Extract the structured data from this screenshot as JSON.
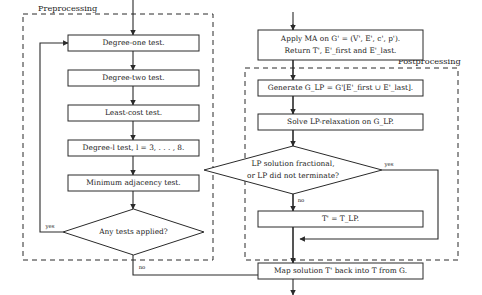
{
  "diagram": {
    "groups": [
      {
        "id": "preprocessing",
        "label": "Preprocessing"
      },
      {
        "id": "postprocessing",
        "label": "Postprocessing"
      }
    ],
    "nodes": [
      {
        "id": "degree-one-test",
        "type": "process",
        "label": "Degree-one test."
      },
      {
        "id": "degree-two-test",
        "type": "process",
        "label": "Degree-two test."
      },
      {
        "id": "least-cost-test",
        "type": "process",
        "label": "Least-cost test."
      },
      {
        "id": "degree-l-test",
        "type": "process",
        "label": "Degree-l test, l = 3, . . . , 8."
      },
      {
        "id": "minimum-adjacency-test",
        "type": "process",
        "label": "Minimum adjacency test."
      },
      {
        "id": "any-tests-applied",
        "type": "decision",
        "label": "Any tests applied?"
      },
      {
        "id": "apply-ma",
        "type": "process",
        "label_line1": "Apply MA on G' = (V', E', c', p').",
        "label_line2": "Return T', E'_first and E'_last."
      },
      {
        "id": "generate-glp",
        "type": "process",
        "label": "Generate G_LP = G'[E'_first ∪ E'_last]."
      },
      {
        "id": "solve-lp-relaxation",
        "type": "process",
        "label": "Solve LP-relaxation on G_LP."
      },
      {
        "id": "lp-check",
        "type": "decision",
        "label_line1": "LP solution fractional,",
        "label_line2": "or LP did not terminate?"
      },
      {
        "id": "assign-tlp",
        "type": "process",
        "label": "T' = T_LP."
      },
      {
        "id": "map-solution",
        "type": "process",
        "label": "Map solution T' back into T from G."
      }
    ],
    "edge_labels": {
      "any_tests_yes": "yes",
      "any_tests_no": "no",
      "lp_check_yes": "yes",
      "lp_check_no": "no"
    },
    "colors": {
      "stroke": "#2a2a2a",
      "fill": "#ffffff",
      "text": "#1a1a1a"
    }
  }
}
